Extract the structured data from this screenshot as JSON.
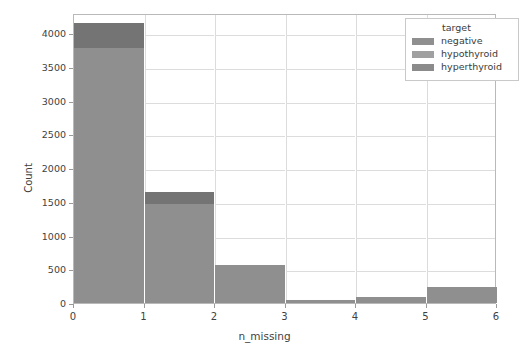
{
  "chart_data": {
    "type": "bar",
    "subtype": "stacked-histogram",
    "title": "",
    "xlabel": "n_missing",
    "ylabel": "Count",
    "xlim": [
      0,
      6
    ],
    "ylim": [
      0,
      4300
    ],
    "xticks": [
      "0",
      "1",
      "2",
      "3",
      "4",
      "5",
      "6"
    ],
    "yticks": [
      "0",
      "500",
      "1000",
      "1500",
      "2000",
      "2500",
      "3000",
      "3500",
      "4000"
    ],
    "ytick_values": [
      0,
      500,
      1000,
      1500,
      2000,
      2500,
      3000,
      3500,
      4000
    ],
    "grid": true,
    "legend_position": "upper right",
    "bin_edges": [
      0,
      1,
      2,
      3,
      4,
      5,
      6
    ],
    "bin_labels": [
      "0-1",
      "1-2",
      "2-3",
      "3-4",
      "4-5",
      "5-6"
    ],
    "categories": [
      "0",
      "1",
      "2",
      "3",
      "4",
      "5"
    ],
    "totals": [
      4150,
      1640,
      560,
      40,
      90,
      240
    ],
    "series": [
      {
        "name": "negative",
        "color": "#8f8f8f",
        "values": [
          3780,
          1470,
          560,
          40,
          90,
          240
        ]
      },
      {
        "name": "hypothyroid",
        "color": "#747474",
        "values": [
          370,
          170,
          0,
          0,
          0,
          0
        ]
      },
      {
        "name": "hyperthyroid",
        "color": "#8b8b8b",
        "values": [
          0,
          0,
          0,
          0,
          0,
          0
        ]
      }
    ]
  },
  "legend": {
    "title": "target",
    "items": [
      {
        "label": "negative",
        "color": "#8f8f8f"
      },
      {
        "label": "hypothyroid",
        "color": "#a0a0a0"
      },
      {
        "label": "hyperthyroid",
        "color": "#8b8b8b"
      }
    ]
  },
  "axes": {
    "xlabel": "n_missing",
    "ylabel": "Count",
    "xticks": [
      "0",
      "1",
      "2",
      "3",
      "4",
      "5",
      "6"
    ],
    "yticks": [
      "4000",
      "3500",
      "3000",
      "2500",
      "2000",
      "1500",
      "1000",
      "500",
      "0"
    ]
  },
  "style": {
    "background": "#ffffff",
    "grid_color": "#dcdcdc",
    "axis_color": "#b9b9b9",
    "text_color": "#3f3f3f"
  }
}
